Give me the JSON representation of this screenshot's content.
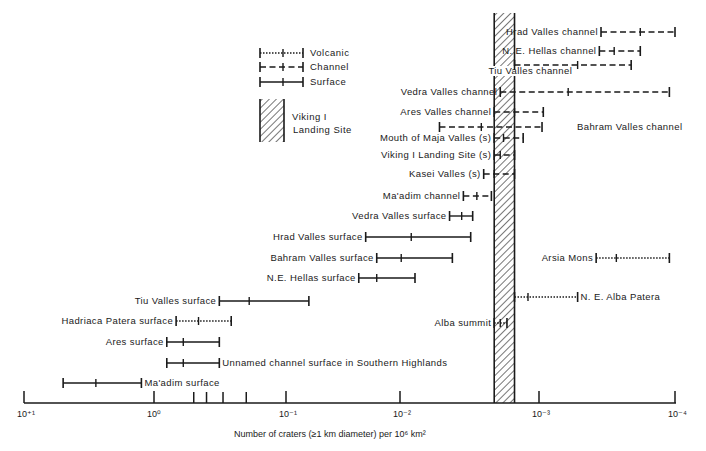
{
  "chart_data": {
    "type": "range-interval",
    "title": "",
    "xlabel": "Number of craters (≥1 km diameter) per 10⁶ km²",
    "x_scale": "log",
    "x_direction": "decreasing-left-to-right",
    "xlim": [
      10,
      0.0001
    ],
    "x_ticks": [
      {
        "value": 10,
        "label": "10⁺¹"
      },
      {
        "value": 1,
        "label": "10⁰"
      },
      {
        "value": 0.5,
        "label": ""
      },
      {
        "value": 0.4,
        "label": ""
      },
      {
        "value": 0.3,
        "label": ""
      },
      {
        "value": 0.2,
        "label": ""
      },
      {
        "value": 0.1,
        "label": "10⁻¹"
      },
      {
        "value": 0.01,
        "label": "10⁻²"
      },
      {
        "value": 0.001,
        "label": "10⁻³"
      },
      {
        "value": 0.0001,
        "label": "10⁻⁴"
      }
    ],
    "reference_band": {
      "name": "Viking I Landing Site",
      "min": 0.0015,
      "max": 0.0021
    },
    "legend": [
      {
        "key": "volcanic",
        "label": "Volcanic",
        "style": "dotted"
      },
      {
        "key": "channel",
        "label": "Channel",
        "style": "dashed"
      },
      {
        "key": "surface",
        "label": "Surface",
        "style": "solid"
      },
      {
        "key": "band",
        "label_lines": [
          "Viking I",
          "Landing Site"
        ],
        "style": "hatched"
      }
    ],
    "legend_position": "top-left-center",
    "series": [
      {
        "name": "Hrad Valles channel",
        "type": "channel",
        "max": 0.00035,
        "mid": 0.00018,
        "min": 8.5e-05,
        "label_side": "left"
      },
      {
        "name": "N. E. Hellas channel",
        "type": "channel",
        "max": 0.00036,
        "mid": 0.00028,
        "min": 0.00018,
        "label_side": "left"
      },
      {
        "name": "Tiu Valles channel",
        "type": "channel",
        "max": 0.0015,
        "mid": 0.00052,
        "min": 0.00021,
        "label_side": "below"
      },
      {
        "name": "Vedra Valles channel",
        "type": "channel",
        "max": 0.0019,
        "mid": 0.00061,
        "min": 0.00011,
        "label_side": "left"
      },
      {
        "name": "Ares Valles channel",
        "type": "channel",
        "max": 0.0021,
        "mid": 0.0015,
        "min": 0.00093,
        "label_side": "left"
      },
      {
        "name": "Bahram Valles channel",
        "type": "channel",
        "max": 0.0052,
        "mid": 0.0026,
        "min": 0.00095,
        "label_side": "right"
      },
      {
        "name": "Mouth of Maja Valles (s)",
        "type": "channel",
        "max": 0.0021,
        "mid": 0.0018,
        "min": 0.0013,
        "label_side": "left"
      },
      {
        "name": "Viking I Landing Site (s)",
        "type": "channel",
        "max": 0.0021,
        "mid": 0.0019,
        "min": 0.0015,
        "label_side": "left"
      },
      {
        "name": "Kasei Valles (s)",
        "type": "channel",
        "max": 0.0025,
        "mid": 0.0021,
        "min": 0.0015,
        "label_side": "left"
      },
      {
        "name": "Ma'adim channel",
        "type": "channel",
        "max": 0.0035,
        "mid": 0.0028,
        "min": 0.0022,
        "label_side": "left"
      },
      {
        "name": "Vedra Valles surface",
        "type": "surface",
        "max": 0.0044,
        "mid": 0.0036,
        "min": 0.003,
        "label_side": "left"
      },
      {
        "name": "Hrad Valles surface",
        "type": "surface",
        "max": 0.02,
        "mid": 0.0083,
        "min": 0.0031,
        "label_side": "left"
      },
      {
        "name": "Bahram Valles surface",
        "type": "surface",
        "max": 0.016,
        "mid": 0.0098,
        "min": 0.0042,
        "label_side": "left"
      },
      {
        "name": "N.E. Hellas surface",
        "type": "surface",
        "max": 0.023,
        "mid": 0.016,
        "min": 0.0078,
        "label_side": "left"
      },
      {
        "name": "Tiu Valles surface",
        "type": "surface",
        "max": 0.32,
        "mid": 0.19,
        "min": 0.063,
        "label_side": "left"
      },
      {
        "name": "Hadriaca Patera surface",
        "type": "volcanic",
        "max": 0.68,
        "mid": 0.46,
        "min": 0.26,
        "label_side": "left"
      },
      {
        "name": "Ares surface",
        "type": "surface",
        "max": 0.8,
        "mid": 0.6,
        "min": 0.32,
        "label_side": "left"
      },
      {
        "name": "Unnamed channel surface in Southern Highlands",
        "type": "surface",
        "max": 0.8,
        "mid": 0.6,
        "min": 0.32,
        "label_side": "right"
      },
      {
        "name": "Ma'adim surface",
        "type": "surface",
        "max": 5.0,
        "mid": 2.8,
        "min": 1.25,
        "label_side": "right"
      },
      {
        "name": "Arsia Mons",
        "type": "volcanic",
        "max": 0.00038,
        "mid": 0.00027,
        "min": 0.00011,
        "label_side": "left"
      },
      {
        "name": "N. E. Alba Patera",
        "type": "volcanic",
        "max": 0.0015,
        "mid": 0.0012,
        "min": 0.00052,
        "label_side": "right"
      },
      {
        "name": "Alba summit",
        "type": "volcanic",
        "max": 0.0021,
        "mid": 0.0019,
        "min": 0.0017,
        "label_side": "left"
      }
    ]
  }
}
